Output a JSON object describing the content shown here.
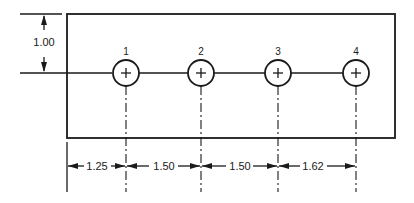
{
  "drawing": {
    "type": "hole-pattern dimensioned drawing",
    "vertical_dimension": {
      "label": "1.00"
    },
    "holes": [
      {
        "id": "1",
        "label": "1"
      },
      {
        "id": "2",
        "label": "2"
      },
      {
        "id": "3",
        "label": "3"
      },
      {
        "id": "4",
        "label": "4"
      }
    ],
    "horizontal_dimensions": [
      {
        "label": "1.25",
        "from": "plate-left-edge",
        "to": "hole-1"
      },
      {
        "label": "1.50",
        "from": "hole-1",
        "to": "hole-2"
      },
      {
        "label": "1.50",
        "from": "hole-2",
        "to": "hole-3"
      },
      {
        "label": "1.62",
        "from": "hole-3",
        "to": "hole-4"
      }
    ],
    "colors": {
      "ink": "#1a1a1a",
      "paper": "#ffffff"
    }
  }
}
